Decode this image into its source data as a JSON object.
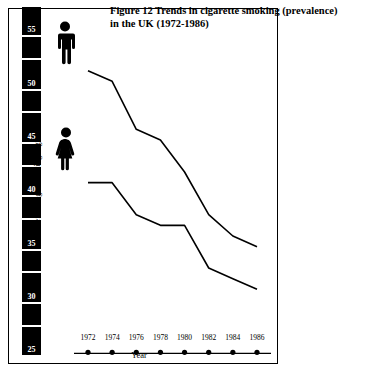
{
  "figure": {
    "title_line1": "Figure 12    Trends in cigarette smoking (prevalence)",
    "title_line2": "in the UK (1972-1986)"
  },
  "axes": {
    "y_title": "Percentage smoking cigarettes",
    "y_unit_label": "%",
    "y_ticks": [
      "55",
      "50",
      "45",
      "40",
      "35",
      "30",
      "25"
    ],
    "x_title": "Year",
    "x_ticks": [
      "1972",
      "1974",
      "1976",
      "1978",
      "1980",
      "1982",
      "1984",
      "1986"
    ]
  },
  "legend": {
    "male_icon": "male-pictogram-icon",
    "female_icon": "female-pictogram-icon"
  },
  "colors": {
    "line": "#000000",
    "axis_bar": "#000000",
    "axis_bar_text": "#ffffff",
    "background": "#ffffff"
  },
  "chart_data": {
    "type": "line",
    "title": "Figure 12    Trends in cigarette smoking (prevalence) in the UK (1972-1986)",
    "xlabel": "Year",
    "ylabel": "Percentage smoking cigarettes",
    "x": [
      1972,
      1974,
      1976,
      1978,
      1980,
      1982,
      1984,
      1986
    ],
    "xlim": [
      1971,
      1987
    ],
    "ylim": [
      24,
      57
    ],
    "yticks": [
      25,
      30,
      35,
      40,
      45,
      50,
      55
    ],
    "grid": false,
    "legend_position": "left-pictograms",
    "series": [
      {
        "name": "Men",
        "icon": "male-pictogram-icon",
        "values": [
          51.5,
          50.5,
          46.0,
          45.0,
          42.0,
          38.0,
          36.0,
          35.0
        ]
      },
      {
        "name": "Women",
        "icon": "female-pictogram-icon",
        "values": [
          41.0,
          41.0,
          38.0,
          37.0,
          37.0,
          33.0,
          32.0,
          31.0
        ]
      }
    ]
  }
}
